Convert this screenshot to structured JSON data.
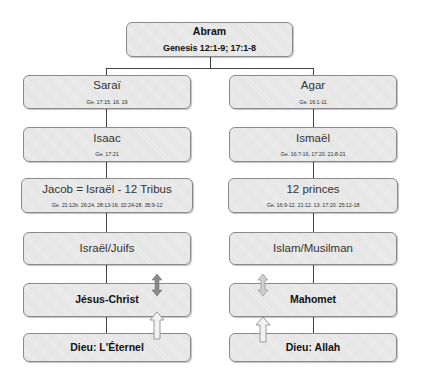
{
  "root": {
    "title": "Abram",
    "ref": "Genesis 12:1-9; 17:1-8"
  },
  "left_column": [
    {
      "title": "Saraï",
      "ref": "Ge. 17:15. 16. 19"
    },
    {
      "title": "Isaac",
      "ref": "Ge. 17:21"
    },
    {
      "title": "Jacob = Israël - 12 Tribus",
      "ref": "Ge. 21:12b. 26:24. 28:13-16. 32:24-28. 35:9-12"
    },
    {
      "title": "Israël/Juifs"
    },
    {
      "title": "Jésus-Christ"
    },
    {
      "title": "Dieu:  L'Éternel"
    }
  ],
  "right_column": [
    {
      "title": "Agar",
      "ref": "Ge. 16:1-11"
    },
    {
      "title": "Ismaël",
      "ref": "Ge. 16:7-16. 17:20. 21:8-21"
    },
    {
      "title": "12 princes",
      "ref": "Ge. 16:9-12. 21:12. 13. 17:20. 25:12-18"
    },
    {
      "title": "Islam/Musilman"
    },
    {
      "title": "Mahomet"
    },
    {
      "title": "Dieu:  Allah"
    }
  ],
  "arrows": {
    "left_double": {
      "type": "double-vertical",
      "color": "#8a8a8a"
    },
    "left_up": {
      "type": "up-outline",
      "color": "#d8d8d8"
    },
    "right_double": {
      "type": "double-vertical",
      "color": "#c8c8c8"
    },
    "right_up": {
      "type": "up-outline",
      "color": "#e0e0e0"
    }
  },
  "colors": {
    "box_fill": "#e8e8e8",
    "box_border": "#8a8a8a",
    "connector": "#444444"
  }
}
